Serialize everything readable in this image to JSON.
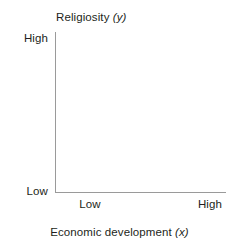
{
  "chart_data": {
    "type": "scatter",
    "title": "",
    "xlabel": "Economic development",
    "xlabel_variable": "x",
    "ylabel": "Religiosity",
    "ylabel_variable": "y",
    "x_tick_labels": [
      "Low",
      "High"
    ],
    "y_tick_labels": [
      "Low",
      "High"
    ],
    "x": [],
    "y": [],
    "series": [],
    "grid": false,
    "legend": null,
    "annotations": [],
    "note": "Empty conceptual axes: no data points, lines, or markers are plotted."
  },
  "figure": {
    "y_axis": {
      "title_text": "Religiosity",
      "title_variable": "(y)",
      "tick_high": "High",
      "tick_low": "Low"
    },
    "x_axis": {
      "title_text": "Economic development",
      "title_variable": "(x)",
      "tick_low": "Low",
      "tick_high": "High"
    }
  },
  "colors": {
    "background": "#ffffff",
    "axis_line": "#9a9a9a",
    "text": "#231f20"
  }
}
